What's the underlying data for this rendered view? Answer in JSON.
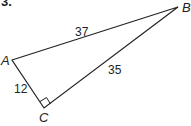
{
  "problem_number": "3.",
  "triangle": {
    "vertices": {
      "A": "A",
      "B": "B",
      "C": "C"
    },
    "sides": {
      "AB": "37",
      "BC": "35",
      "AC": "12"
    },
    "right_angle_at": "C"
  }
}
